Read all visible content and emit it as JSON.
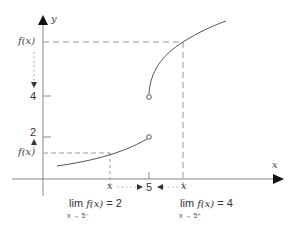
{
  "axes": {
    "x_label": "x",
    "y_label": "y"
  },
  "ticks": {
    "x_five": "5",
    "y_four": "4",
    "y_two": "2"
  },
  "labels": {
    "fx_upper": "f(x)",
    "fx_lower": "f(x)",
    "x_left": "x",
    "x_right": "x"
  },
  "limits": {
    "left": {
      "expr": "lim f(x) = 2",
      "lim_word": "lim",
      "func": "f(x)",
      "rhs": "= 2",
      "subscript": "x → 5⁻"
    },
    "right": {
      "expr": "lim f(x) = 4",
      "lim_word": "lim",
      "func": "f(x)",
      "rhs": "= 4",
      "subscript": "x → 5⁺"
    }
  },
  "colors": {
    "axis": "#888888",
    "curve": "#555555",
    "dashed": "#999999",
    "arrow": "#111111"
  }
}
